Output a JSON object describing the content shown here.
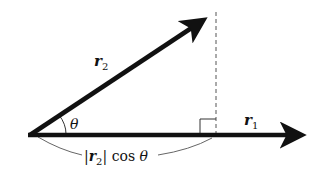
{
  "diagram": {
    "colors": {
      "stroke": "#111111",
      "guide": "#444444",
      "background": "#ffffff"
    },
    "vectors": [
      {
        "name": "r1",
        "label": "r",
        "subscript": "1"
      },
      {
        "name": "r2",
        "label": "r",
        "subscript": "2"
      }
    ],
    "angle_label": "θ",
    "projection_label": {
      "bar_open": "|",
      "vector": "r",
      "subscript": "2",
      "bar_close": "|",
      "func": " cos ",
      "angle": "θ"
    }
  }
}
